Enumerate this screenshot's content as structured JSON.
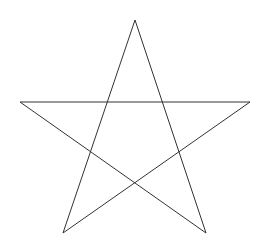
{
  "diagram": {
    "shape": "pentagram",
    "background": "#ffffff",
    "stroke_color": "#333333",
    "stroke_width": 1,
    "vertices": [
      {
        "name": "top",
        "x": 135,
        "y": 20
      },
      {
        "name": "bottom-right",
        "x": 206,
        "y": 233
      },
      {
        "name": "left",
        "x": 20,
        "y": 102
      },
      {
        "name": "right",
        "x": 250,
        "y": 102
      },
      {
        "name": "bottom-left",
        "x": 63,
        "y": 233
      }
    ]
  }
}
